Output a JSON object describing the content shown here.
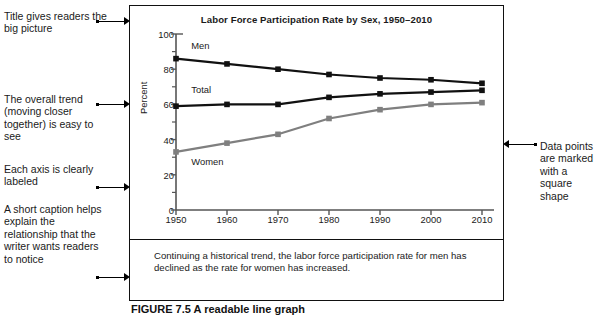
{
  "figure": {
    "title": "Labor Force Participation Rate by Sex, 1950–2010",
    "caption": "Continuing a historical trend, the labor force participation rate for men has declined as the rate for women has increased.",
    "figure_label": "FIGURE 7.5  A readable line graph"
  },
  "annotations": {
    "left": [
      {
        "id": "title-note",
        "text": "Title gives readers the big picture"
      },
      {
        "id": "trend-note",
        "text": "The overall trend (moving closer together) is easy to see"
      },
      {
        "id": "axis-note",
        "text": "Each axis is clearly labeled"
      },
      {
        "id": "caption-note",
        "text": "A short caption helps explain the relationship that the writer wants readers to notice"
      }
    ],
    "right": [
      {
        "id": "marker-note",
        "text": "Data points are marked with a square shape"
      }
    ]
  },
  "chart_data": {
    "type": "line",
    "title": "Labor Force Participation Rate by Sex, 1950–2010",
    "xlabel": "",
    "ylabel": "Percent",
    "x": [
      1950,
      1960,
      1970,
      1980,
      1990,
      2000,
      2010
    ],
    "categories": [
      "1950",
      "1960",
      "1970",
      "1980",
      "1990",
      "2000",
      "2010"
    ],
    "ylim": [
      0,
      100
    ],
    "yticks": [
      0,
      20,
      40,
      60,
      80,
      100
    ],
    "yticks_minor": [
      10,
      30,
      50,
      70,
      90
    ],
    "grid": false,
    "legend": "inline-labels",
    "series": [
      {
        "name": "Men",
        "color": "#111111",
        "marker": "square",
        "values": [
          86,
          83,
          80,
          77,
          75,
          74,
          72
        ],
        "label_x": 1953,
        "label_y": 93
      },
      {
        "name": "Total",
        "color": "#111111",
        "marker": "square",
        "values": [
          59,
          60,
          60,
          64,
          66,
          67,
          68
        ],
        "label_x": 1953,
        "label_y": 68
      },
      {
        "name": "Women",
        "color": "#7f7f7f",
        "marker": "square",
        "values": [
          33,
          38,
          43,
          52,
          57,
          60,
          61
        ],
        "label_x": 1953,
        "label_y": 27
      }
    ]
  }
}
